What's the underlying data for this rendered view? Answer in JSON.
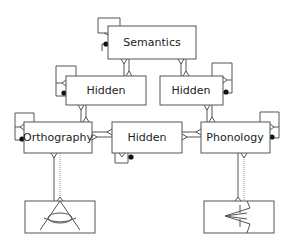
{
  "diagram": {
    "type": "connectionist-triangle-model",
    "nodes": {
      "semantics": {
        "label": "Semantics"
      },
      "hidden_left": {
        "label": "Hidden"
      },
      "hidden_right": {
        "label": "Hidden"
      },
      "orthography": {
        "label": "Orthography"
      },
      "hidden_center": {
        "label": "Hidden"
      },
      "phonology": {
        "label": "Phonology"
      }
    },
    "icons": {
      "orthography_input": "eye-icon",
      "phonology_output": "mouth-icon"
    },
    "edges": [
      {
        "from": "semantics",
        "to": "hidden_left",
        "style": "bidirectional"
      },
      {
        "from": "semantics",
        "to": "hidden_right",
        "style": "bidirectional"
      },
      {
        "from": "hidden_left",
        "to": "orthography",
        "style": "bidirectional"
      },
      {
        "from": "hidden_right",
        "to": "phonology",
        "style": "bidirectional"
      },
      {
        "from": "orthography",
        "to": "hidden_center",
        "style": "bidirectional"
      },
      {
        "from": "hidden_center",
        "to": "phonology",
        "style": "bidirectional"
      },
      {
        "from": "orthography",
        "to": "eye",
        "style": "solid+dotted"
      },
      {
        "from": "phonology",
        "to": "mouth",
        "style": "solid+dotted"
      }
    ],
    "self_loops": [
      "semantics",
      "hidden_left",
      "hidden_right",
      "orthography",
      "hidden_center",
      "phonology"
    ],
    "colors": {
      "stroke": "#555555",
      "text": "#222222",
      "dot": "#111111",
      "background": "#ffffff"
    }
  }
}
